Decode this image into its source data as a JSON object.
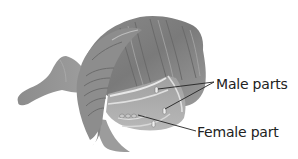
{
  "figure": {
    "colors": {
      "background": "#ffffff",
      "petal_fill": "#8f8f8f",
      "petal_dark": "#6e6e6e",
      "petal_light": "#b5b5b5",
      "vein_light": "#d9d9d9",
      "leader_line": "#222222",
      "label_text": "#222222"
    }
  },
  "labels": {
    "male": "Male parts",
    "female": "Female part"
  }
}
